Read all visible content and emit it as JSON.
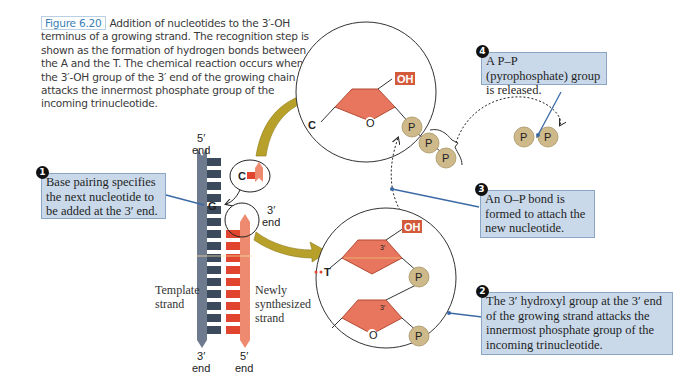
{
  "caption": {
    "figure_label": "Figure 6.20",
    "text": "Addition of nucleotides to the 3′-OH terminus of a growing strand. The recognition step is shown as the formation of hydrogen bonds between the A and the T. The chemical reaction occurs when the 3′-OH group of the 3′ end of the growing chain attacks the innermost phosphate group of the incoming trinucleotide."
  },
  "strands": {
    "template_top": "5′\nend",
    "template_bottom": "3′\nend",
    "new_top": "3′\nend",
    "new_bottom": "5′\nend",
    "template_label": "Template\nstrand",
    "new_label": "Newly\nsynthesized\nstrand",
    "base_G": "G",
    "base_C": "C"
  },
  "top_circle": {
    "oh": "OH",
    "c": "C",
    "o": "O",
    "phosphates": [
      "P",
      "P",
      "P"
    ]
  },
  "bottom_circle": {
    "oh": "OH",
    "t": "T",
    "o": "O",
    "three_prime_1": "3′",
    "three_prime_2": "3′",
    "phosphates": [
      "P",
      "P"
    ]
  },
  "pyrophosphate": [
    "P",
    "P"
  ],
  "callouts": [
    {
      "num": "1",
      "text": "Base pairing specifies the next nucleotide to be added at the 3′ end."
    },
    {
      "num": "2",
      "text": "The 3′ hydroxyl group at the 3′ end of the growing strand attacks the innermost phosphate group of the incoming trinucleotide."
    },
    {
      "num": "3",
      "text": "An O–P bond is formed to attach the new nucleotide."
    },
    {
      "num": "4",
      "text": "A P–P (pyrophosphate) group is released."
    }
  ],
  "colors": {
    "template": "#3c4a5e",
    "template_backbone": "#6e7b8e",
    "new_strand": "#e2452f",
    "new_backbone": "#ee8a70",
    "sugar": "#e8765f",
    "phosphate": "#cdb98a",
    "callout_bg": "#c9d9ea",
    "arrow": "#b8a12a",
    "leader": "#3a6aa6"
  }
}
